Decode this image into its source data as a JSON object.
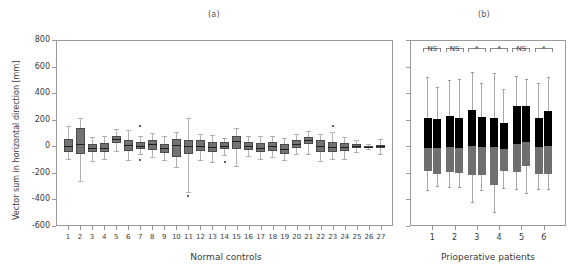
{
  "panels": {
    "a_label": "(a)",
    "b_label": "(b)"
  },
  "axis": {
    "ylabel": "Vector sum in horizontal direction  [mm]",
    "yticks": [
      800,
      600,
      400,
      200,
      0,
      -200,
      -400,
      -600
    ],
    "xlabel_left": "Normal controls",
    "xlabel_right": "Prioperative patients"
  },
  "chart_data": [
    {
      "type": "box",
      "title": "(a)",
      "xlabel": "Normal controls",
      "ylabel": "Vector sum in horizontal direction [mm]",
      "ylim": [
        -600,
        800
      ],
      "yticks": [
        -600,
        -400,
        -200,
        0,
        200,
        400,
        600,
        800
      ],
      "grid": false,
      "legend": "none",
      "categories": [
        "1",
        "2",
        "3",
        "4",
        "5",
        "6",
        "7",
        "8",
        "9",
        "10",
        "11",
        "12",
        "13",
        "14",
        "15",
        "16",
        "17",
        "18",
        "19",
        "20",
        "21",
        "22",
        "23",
        "24",
        "25",
        "26",
        "27"
      ],
      "boxes": [
        {
          "cat": "1",
          "whisker_low": -95,
          "q1": -45,
          "median": 5,
          "q3": 55,
          "whisker_high": 155,
          "outliers": []
        },
        {
          "cat": "2",
          "whisker_low": -260,
          "q1": -60,
          "median": 15,
          "q3": 135,
          "whisker_high": 215,
          "outliers": []
        },
        {
          "cat": "3",
          "whisker_low": -110,
          "q1": -40,
          "median": -15,
          "q3": 15,
          "whisker_high": 70,
          "outliers": []
        },
        {
          "cat": "4",
          "whisker_low": -95,
          "q1": -45,
          "median": -10,
          "q3": 25,
          "whisker_high": 75,
          "outliers": []
        },
        {
          "cat": "5",
          "whisker_low": -35,
          "q1": 25,
          "median": 55,
          "q3": 80,
          "whisker_high": 130,
          "outliers": []
        },
        {
          "cat": "6",
          "whisker_low": -105,
          "q1": -35,
          "median": 10,
          "q3": 45,
          "whisker_high": 120,
          "outliers": []
        },
        {
          "cat": "7",
          "whisker_low": -60,
          "q1": -20,
          "median": 5,
          "q3": 35,
          "whisker_high": 75,
          "outliers": [
            150,
            -100
          ]
        },
        {
          "cat": "8",
          "whisker_low": -80,
          "q1": -30,
          "median": 15,
          "q3": 50,
          "whisker_high": 100,
          "outliers": []
        },
        {
          "cat": "9",
          "whisker_low": -105,
          "q1": -50,
          "median": -15,
          "q3": 20,
          "whisker_high": 75,
          "outliers": []
        },
        {
          "cat": "10",
          "whisker_low": -155,
          "q1": -80,
          "median": 10,
          "q3": 55,
          "whisker_high": 105,
          "outliers": []
        },
        {
          "cat": "11",
          "whisker_low": -345,
          "q1": -55,
          "median": 0,
          "q3": 50,
          "whisker_high": 215,
          "outliers": [
            -375
          ]
        },
        {
          "cat": "12",
          "whisker_low": -100,
          "q1": -35,
          "median": 5,
          "q3": 50,
          "whisker_high": 95,
          "outliers": []
        },
        {
          "cat": "13",
          "whisker_low": -115,
          "q1": -45,
          "median": -5,
          "q3": 35,
          "whisker_high": 85,
          "outliers": []
        },
        {
          "cat": "14",
          "whisker_low": -65,
          "q1": -20,
          "median": 5,
          "q3": 30,
          "whisker_high": 65,
          "outliers": [
            -115
          ]
        },
        {
          "cat": "15",
          "whisker_low": -150,
          "q1": -20,
          "median": 40,
          "q3": 80,
          "whisker_high": 135,
          "outliers": []
        },
        {
          "cat": "16",
          "whisker_low": -75,
          "q1": -25,
          "median": 5,
          "q3": 35,
          "whisker_high": 75,
          "outliers": []
        },
        {
          "cat": "17",
          "whisker_low": -95,
          "q1": -45,
          "median": -10,
          "q3": 25,
          "whisker_high": 80,
          "outliers": []
        },
        {
          "cat": "18",
          "whisker_low": -80,
          "q1": -35,
          "median": 0,
          "q3": 30,
          "whisker_high": 75,
          "outliers": []
        },
        {
          "cat": "19",
          "whisker_low": -105,
          "q1": -55,
          "median": -20,
          "q3": 15,
          "whisker_high": 65,
          "outliers": []
        },
        {
          "cat": "20",
          "whisker_low": -60,
          "q1": -15,
          "median": 15,
          "q3": 45,
          "whisker_high": 90,
          "outliers": []
        },
        {
          "cat": "21",
          "whisker_low": -60,
          "q1": 15,
          "median": 45,
          "q3": 70,
          "whisker_high": 115,
          "outliers": []
        },
        {
          "cat": "22",
          "whisker_low": -110,
          "q1": -45,
          "median": 0,
          "q3": 45,
          "whisker_high": 95,
          "outliers": []
        },
        {
          "cat": "23",
          "whisker_low": -95,
          "q1": -40,
          "median": -5,
          "q3": 35,
          "whisker_high": 105,
          "outliers": [
            155
          ]
        },
        {
          "cat": "24",
          "whisker_low": -95,
          "q1": -35,
          "median": -5,
          "q3": 25,
          "whisker_high": 70,
          "outliers": []
        },
        {
          "cat": "25",
          "whisker_low": -40,
          "q1": -15,
          "median": 0,
          "q3": 15,
          "whisker_high": 45,
          "outliers": []
        },
        {
          "cat": "26",
          "whisker_low": -20,
          "q1": -10,
          "median": -5,
          "q3": 5,
          "whisker_high": 20,
          "outliers": []
        },
        {
          "cat": "27",
          "whisker_low": -55,
          "q1": -10,
          "median": 0,
          "q3": 10,
          "whisker_high": 55,
          "outliers": []
        }
      ]
    },
    {
      "type": "box",
      "title": "(b)",
      "xlabel": "Prioperative patients",
      "ylabel": "Vector sum in horizontal direction [mm]",
      "ylim": [
        -600,
        800
      ],
      "yticks": [
        -600,
        -400,
        -200,
        0,
        200,
        400,
        600,
        800
      ],
      "grid": false,
      "legend": "none",
      "note": "paired bars per patient: left = pre, right = post; upper half black, lower half gray",
      "categories": [
        "1",
        "2",
        "3",
        "4",
        "5",
        "6"
      ],
      "boxes": [
        {
          "cat": "1",
          "pair": "left",
          "whisker_low": -330,
          "q1": -185,
          "median": -10,
          "q3": 210,
          "whisker_high": 520,
          "outliers": []
        },
        {
          "cat": "1",
          "pair": "right",
          "whisker_low": -300,
          "q1": -205,
          "median": -10,
          "q3": 205,
          "whisker_high": 450,
          "outliers": []
        },
        {
          "cat": "2",
          "pair": "left",
          "whisker_low": -310,
          "q1": -190,
          "median": -5,
          "q3": 230,
          "whisker_high": 500,
          "outliers": []
        },
        {
          "cat": "2",
          "pair": "right",
          "whisker_low": -310,
          "q1": -200,
          "median": -10,
          "q3": 210,
          "whisker_high": 505,
          "outliers": []
        },
        {
          "cat": "3",
          "pair": "left",
          "whisker_low": -420,
          "q1": -215,
          "median": 0,
          "q3": 270,
          "whisker_high": 560,
          "outliers": []
        },
        {
          "cat": "3",
          "pair": "right",
          "whisker_low": -330,
          "q1": -215,
          "median": -5,
          "q3": 220,
          "whisker_high": 480,
          "outliers": []
        },
        {
          "cat": "4",
          "pair": "left",
          "whisker_low": -495,
          "q1": -290,
          "median": -5,
          "q3": 215,
          "whisker_high": 555,
          "outliers": []
        },
        {
          "cat": "4",
          "pair": "right",
          "whisker_low": -315,
          "q1": -185,
          "median": -20,
          "q3": 175,
          "whisker_high": 430,
          "outliers": []
        },
        {
          "cat": "5",
          "pair": "left",
          "whisker_low": -320,
          "q1": -195,
          "median": 15,
          "q3": 300,
          "whisker_high": 530,
          "outliers": []
        },
        {
          "cat": "5",
          "pair": "right",
          "whisker_low": -350,
          "q1": -150,
          "median": 30,
          "q3": 300,
          "whisker_high": 510,
          "outliers": []
        },
        {
          "cat": "6",
          "pair": "left",
          "whisker_low": -325,
          "q1": -210,
          "median": -5,
          "q3": 215,
          "whisker_high": 480,
          "outliers": []
        },
        {
          "cat": "6",
          "pair": "right",
          "whisker_low": -320,
          "q1": -205,
          "median": 0,
          "q3": 265,
          "whisker_high": 525,
          "outliers": []
        }
      ],
      "significance": [
        {
          "group": "1",
          "label": "NS"
        },
        {
          "group": "2",
          "label": "NS"
        },
        {
          "group": "3",
          "label": "*"
        },
        {
          "group": "4",
          "label": "*"
        },
        {
          "group": "5",
          "label": "NS"
        },
        {
          "group": "6",
          "label": "*"
        }
      ]
    }
  ],
  "colors": {
    "box_fill_a": "#727272",
    "box_edge_a": "#4a4a4a",
    "bar_upper_b": "#000000",
    "bar_lower_b": "#6f6f6f",
    "axis": "#9a9a9a",
    "text": "#3a3a3a"
  }
}
